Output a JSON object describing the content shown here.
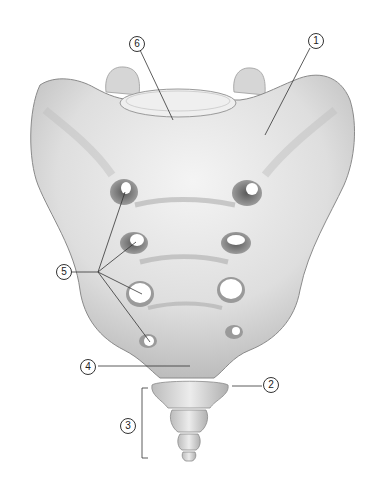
{
  "figure": {
    "colors": {
      "bone_light": "#f2f2f2",
      "bone_mid": "#d8d8d8",
      "bone_shadow": "#9a9a9a",
      "foramen_shadow": "#6e6e6e",
      "leader_line": "#333333",
      "background": "#ffffff"
    },
    "labels": [
      {
        "number": "1",
        "x": 308,
        "y": 33
      },
      {
        "number": "2",
        "x": 263,
        "y": 377
      },
      {
        "number": "3",
        "x": 120,
        "y": 418
      },
      {
        "number": "4",
        "x": 80,
        "y": 359
      },
      {
        "number": "5",
        "x": 62,
        "y": 264
      },
      {
        "number": "6",
        "x": 129,
        "y": 36
      }
    ]
  }
}
